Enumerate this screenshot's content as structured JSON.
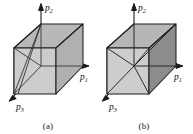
{
  "figure": {
    "type": "diagram",
    "background_color": "#ffffff",
    "line_color": "#1a1a1e",
    "face_colors": {
      "top": "#b8b8b8",
      "front": "#c9c9c9",
      "left": "#bdbdbd",
      "right_light": "#b3b3b3",
      "right_dark": "#8c8c8c",
      "interior": "#d2d2d2"
    }
  },
  "panels": [
    {
      "id": "a",
      "caption": "(a)",
      "axes": [
        {
          "name": "p2",
          "base": "p",
          "sub": "2",
          "direction": "up"
        },
        {
          "name": "p1",
          "base": "p",
          "sub": "1",
          "direction": "right"
        },
        {
          "name": "p3",
          "base": "p",
          "sub": "3",
          "direction": "down-left"
        }
      ],
      "shape": "cube with diagonal edges on the near-left face"
    },
    {
      "id": "b",
      "caption": "(b)",
      "axes": [
        {
          "name": "p2",
          "base": "p",
          "sub": "2",
          "direction": "up"
        },
        {
          "name": "p1",
          "base": "p",
          "sub": "1",
          "direction": "right"
        },
        {
          "name": "p3",
          "base": "p",
          "sub": "3",
          "direction": "down-left"
        }
      ],
      "shape": "cube with interior diagonals meeting at an inner vertex, dark right face"
    }
  ]
}
